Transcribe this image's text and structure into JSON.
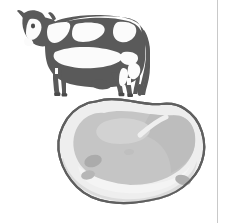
{
  "page": {
    "width": 227,
    "height": 223,
    "background_color": "#ffffff",
    "title": "Cow and cut of meat illustration"
  },
  "rules": {
    "right_margin": {
      "name": "right-margin-rule",
      "color": "#c9c9c9",
      "x": 217,
      "width": 1
    }
  },
  "figures": [
    {
      "id": "cow",
      "label": "Holstein dairy cow, side view facing left",
      "bounds": {
        "x": 17,
        "y": 9,
        "width": 126,
        "height": 88
      },
      "colors": {
        "hide_dark": "#5a5a5a",
        "hide_patch_light": "#fbfbfb",
        "outline": "#4f4f4f",
        "hoof": "#4a4a4a"
      }
    },
    {
      "id": "meat",
      "label": "Cut of beef / steak with fat cap, three-quarter view",
      "bounds": {
        "x": 58,
        "y": 98,
        "width": 148,
        "height": 107
      },
      "colors": {
        "outline": "#5f5f5f",
        "fat_cap": "#f2f2f2",
        "side_face": "#dcdcdc",
        "muscle_center": "#c5c5c5",
        "muscle_shadow": "#b4b4b4",
        "marbling_dark": "#a8a8a8"
      }
    }
  ],
  "accent_colors": {
    "paper": "#ffffff",
    "ink_dark": "#5a5a5a",
    "ink_mid": "#c5c5c5",
    "ink_light": "#f2f2f2",
    "rule": "#c9c9c9"
  }
}
